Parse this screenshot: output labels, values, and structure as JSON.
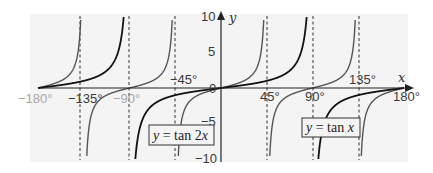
{
  "chart_data": {
    "type": "line",
    "title": "",
    "xlabel": "x",
    "ylabel": "y",
    "xlim": [
      -180,
      180
    ],
    "ylim": [
      -10,
      10
    ],
    "x_ticks": [
      "-180°",
      "-135°",
      "-90°",
      "-45°",
      "45°",
      "90°",
      "135°",
      "180°"
    ],
    "y_ticks": [
      "10",
      "5",
      "0",
      "-5",
      "-10"
    ],
    "asymptotes_dashed": [
      -135,
      -90,
      -45,
      45,
      90,
      135
    ],
    "grid": false,
    "series": [
      {
        "name": "y = tan x",
        "function": "tan(x)",
        "color": "#111111",
        "stroke_width": 1.8,
        "sample_points": [
          [
            -180,
            0
          ],
          [
            -135,
            1
          ],
          [
            -120,
            1.73
          ],
          [
            -100,
            5.67
          ],
          [
            -90,
            null
          ],
          [
            -80,
            -5.67
          ],
          [
            -45,
            -1
          ],
          [
            0,
            0
          ],
          [
            45,
            1
          ],
          [
            80,
            5.67
          ],
          [
            90,
            null
          ],
          [
            100,
            -5.67
          ],
          [
            135,
            -1
          ],
          [
            180,
            0
          ]
        ]
      },
      {
        "name": "y = tan 2x",
        "function": "tan(2x)",
        "color": "#555555",
        "stroke_width": 1.4,
        "sample_points": [
          [
            -180,
            0
          ],
          [
            -157.5,
            1
          ],
          [
            -140,
            5.67
          ],
          [
            -135,
            null
          ],
          [
            -130,
            -5.67
          ],
          [
            -112.5,
            -1
          ],
          [
            -90,
            0
          ],
          [
            -67.5,
            1
          ],
          [
            -50,
            5.67
          ],
          [
            -45,
            null
          ],
          [
            -40,
            -5.67
          ],
          [
            -22.5,
            -1
          ],
          [
            0,
            0
          ],
          [
            22.5,
            1
          ],
          [
            40,
            5.67
          ],
          [
            45,
            null
          ],
          [
            50,
            -5.67
          ],
          [
            67.5,
            -1
          ],
          [
            90,
            0
          ],
          [
            112.5,
            1
          ],
          [
            130,
            5.67
          ],
          [
            135,
            null
          ],
          [
            140,
            -5.67
          ],
          [
            157.5,
            -1
          ],
          [
            180,
            0
          ]
        ]
      }
    ],
    "annotations": [
      {
        "text": "y = tan 2x",
        "boxed": true,
        "near_x": -45,
        "near_y": -6.5
      },
      {
        "text": "y = tan x",
        "boxed": true,
        "near_x": 105,
        "near_y": -6.5
      }
    ]
  },
  "axis": {
    "x_label": "x",
    "y_label": "y",
    "x_tick_labels": {
      "n180": "−180°",
      "n135": "−135°",
      "n90": "−90°",
      "n45": "−45°",
      "p45": "45°",
      "p90": "90°",
      "p135": "135°",
      "p180": "180°"
    },
    "y_tick_labels": {
      "p10": "10",
      "p5": "5",
      "zero": "0",
      "n5": "−5",
      "n10": "−10"
    }
  },
  "legend": {
    "tan2x_prefix": "y",
    "tan2x_rest": " = tan 2",
    "tan2x_var": "x",
    "tanx_prefix": "y",
    "tanx_rest": " = tan ",
    "tanx_var": "x"
  },
  "colors": {
    "tanx": "#111111",
    "tan2x": "#5a5a5a",
    "axis": "#222222",
    "dashed": "#333333",
    "panel": "#f3f3f3"
  }
}
